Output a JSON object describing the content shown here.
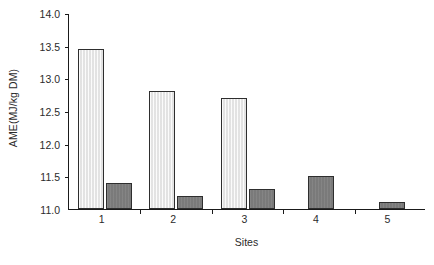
{
  "chart_data": {
    "type": "bar",
    "title": "",
    "subtitle": "",
    "xlabel": "Sites",
    "ylabel": "AME(MJ/kg DM)",
    "categories": [
      "1",
      "2",
      "3",
      "4",
      "5"
    ],
    "ylim": [
      11.0,
      14.0
    ],
    "ytick_labels": [
      "11.0",
      "11.5",
      "12.0",
      "12.5",
      "13.0",
      "13.5",
      "14.0"
    ],
    "ytick_values": [
      11.0,
      11.5,
      12.0,
      12.5,
      13.0,
      13.5,
      14.0
    ],
    "grid": false,
    "legend": "none",
    "annotations": [],
    "series": [
      {
        "name": "light-series",
        "color": "#e7e7e7",
        "edge_color": "#2e2e2e",
        "values": [
          13.45,
          12.8,
          12.7,
          null,
          null
        ]
      },
      {
        "name": "dark-series",
        "color": "#7e7e7e",
        "edge_color": "#2e2e2e",
        "values": [
          11.4,
          11.2,
          11.3,
          11.5,
          11.1
        ]
      }
    ]
  },
  "axes": {
    "axis_color": "#1a1a1a",
    "background": "#ffffff"
  }
}
